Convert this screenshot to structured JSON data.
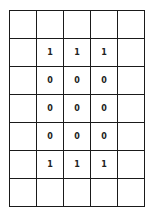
{
  "grid": {
    "rows": 7,
    "cols": 5,
    "cells": [
      [
        "",
        "",
        "",
        "",
        ""
      ],
      [
        "",
        "1",
        "1",
        "1",
        ""
      ],
      [
        "",
        "0",
        "0",
        "0",
        ""
      ],
      [
        "",
        "0",
        "0",
        "0",
        ""
      ],
      [
        "",
        "0",
        "0",
        "0",
        ""
      ],
      [
        "",
        "1",
        "1",
        "1",
        ""
      ],
      [
        "",
        "",
        "",
        "",
        ""
      ]
    ]
  }
}
